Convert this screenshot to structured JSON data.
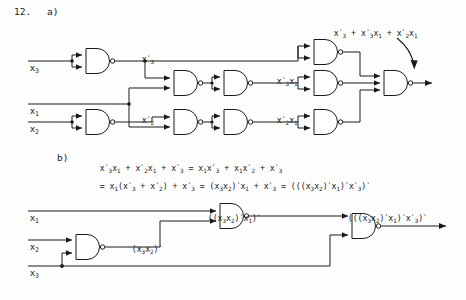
{
  "page": {
    "problem_number": "12.",
    "part_a_label": "a)",
    "part_b_label": "b)"
  },
  "circuit_a": {
    "inputs": [
      {
        "name": "x3",
        "text_main": "x",
        "text_sub": "3"
      },
      {
        "name": "x1",
        "text_main": "x",
        "text_sub": "1"
      },
      {
        "name": "x2",
        "text_main": "x",
        "text_sub": "2"
      }
    ],
    "signal_labels": [
      {
        "id": "x3prime",
        "main": "x",
        "sub": "3",
        "prime": "'"
      },
      {
        "id": "x2prime",
        "main": "x",
        "sub": "2",
        "prime": "'"
      },
      {
        "id": "x3prime_x1",
        "text": "x3'x1"
      },
      {
        "id": "x2prime_x1",
        "text": "x2'x1"
      }
    ],
    "output_label": "x3' + x3'x1 + x2'x1",
    "gate_count": 10,
    "gate_type": "NAND"
  },
  "equations": {
    "line1": "x3'x1 + x2'x1 + x3' = x1x3' + x1x2' + x3'",
    "line2": "= x1(x3' + x2') + x3' = (x3x2)'x1 + x3' = (((x3x2)'x1)'x3')'"
  },
  "circuit_b": {
    "inputs": [
      {
        "name": "x1",
        "text_main": "x",
        "text_sub": "1"
      },
      {
        "name": "x2",
        "text_main": "x",
        "text_sub": "2"
      },
      {
        "name": "x3",
        "text_main": "x",
        "text_sub": "3"
      }
    ],
    "signal_labels": [
      {
        "id": "nand1out",
        "text": "(x3x2)'"
      },
      {
        "id": "nand2out",
        "text": "((x3x2)'x1)'"
      }
    ],
    "output_label": "(((x3x2)'x1)'x3')'",
    "gate_count": 3,
    "gate_type": "NAND"
  },
  "colors": {
    "ink": "#1a1a1a",
    "paper": "#fefefe"
  }
}
